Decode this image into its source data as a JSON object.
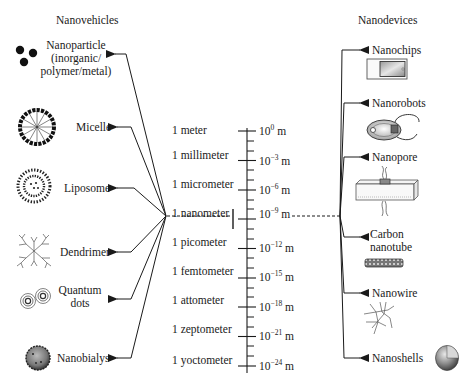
{
  "headers": {
    "left": "Nanovehicles",
    "right": "Nanodevices"
  },
  "nanovehicles": [
    {
      "label_lines": [
        "Nanoparticle",
        "(inorganic/",
        "polymer/metal)"
      ],
      "icon": "nanoparticle-icon"
    },
    {
      "label_lines": [
        "Micelle"
      ],
      "icon": "micelle-icon"
    },
    {
      "label_lines": [
        "Liposome"
      ],
      "icon": "liposome-icon"
    },
    {
      "label_lines": [
        "Dendrimer"
      ],
      "icon": "dendrimer-icon"
    },
    {
      "label_lines": [
        "Quantum",
        "dots"
      ],
      "icon": "quantum-dots-icon"
    },
    {
      "label_lines": [
        "Nanobialys"
      ],
      "icon": "nanobialys-icon"
    }
  ],
  "nanodevices": [
    {
      "label_lines": [
        "Nanochips"
      ],
      "icon": "nanochip-icon"
    },
    {
      "label_lines": [
        "Nanorobots"
      ],
      "icon": "nanorobot-icon"
    },
    {
      "label_lines": [
        "Nanopore"
      ],
      "icon": "nanopore-icon"
    },
    {
      "label_lines": [
        "Carbon",
        "nanotube"
      ],
      "icon": "carbon-nanotube-icon"
    },
    {
      "label_lines": [
        "Nanowire"
      ],
      "icon": "nanowire-icon"
    },
    {
      "label_lines": [
        "Nanoshells"
      ],
      "icon": "nanoshell-icon"
    }
  ],
  "scale": {
    "units": [
      {
        "name": "1 meter",
        "base": "10",
        "exp": "0",
        "unit": "m"
      },
      {
        "name": "1 millimeter",
        "base": "10",
        "exp": "−3",
        "unit": "m"
      },
      {
        "name": "1 micrometer",
        "base": "10",
        "exp": "−6",
        "unit": "m"
      },
      {
        "name": "1 nanometer",
        "base": "10",
        "exp": "−9",
        "unit": "m"
      },
      {
        "name": "1 picometer",
        "base": "10",
        "exp": "−12",
        "unit": "m"
      },
      {
        "name": "1 femtometer",
        "base": "10",
        "exp": "−15",
        "unit": "m"
      },
      {
        "name": "1 attometer",
        "base": "10",
        "exp": "−18",
        "unit": "m"
      },
      {
        "name": "1 zeptometer",
        "base": "10",
        "exp": "−21",
        "unit": "m"
      },
      {
        "name": "1 yoctometer",
        "base": "10",
        "exp": "−24",
        "unit": "m"
      }
    ],
    "highlighted": "1 nanometer"
  },
  "colors": {
    "line": "#1a1a1a",
    "text": "#1a1a1a",
    "background": "#ffffff"
  }
}
